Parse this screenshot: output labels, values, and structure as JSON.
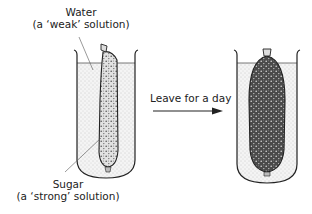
{
  "diagram": {
    "labels": {
      "water_line1": "Water",
      "water_line2": "(a ‘weak’ solution)",
      "sugar_line1": "Sugar",
      "sugar_line2": "(a ‘strong’ solution)",
      "arrow_text": "Leave for a day"
    },
    "states": [
      {
        "name": "before",
        "bag": "thin sugar bag in water"
      },
      {
        "name": "after",
        "bag": "swollen sugar bag in water"
      }
    ],
    "colors": {
      "line": "#222222",
      "water_dots": "#9a9a9a",
      "sugar_fill": "#3a3a3a",
      "background": "#ffffff"
    }
  }
}
